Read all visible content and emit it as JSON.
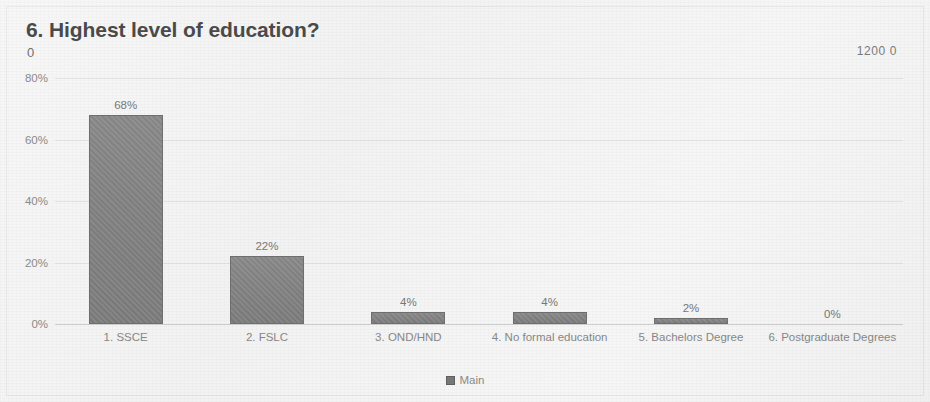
{
  "header": {
    "title": "6. Highest level of education?",
    "subtitle_zero": "0",
    "corner_value": "1200 0"
  },
  "legend": {
    "label": "Main",
    "swatch_icon": "legend-square-icon"
  },
  "colors": {
    "bar": "#848484",
    "bar_border": "#6e6e6e",
    "text": "#868686",
    "title": "#4a4a4a",
    "gridline": "#ededed",
    "background": "#f4f4f4"
  },
  "chart_data": {
    "type": "bar",
    "title": "6. Highest level of education?",
    "xlabel": "",
    "ylabel": "",
    "categories": [
      "1. SSCE",
      "2. FSLC",
      "3. OND/HND",
      "4. No formal education",
      "5. Bachelors Degree",
      "6. Postgraduate Degrees"
    ],
    "values": [
      68,
      22,
      4,
      4,
      2,
      0
    ],
    "data_labels": [
      "68%",
      "22%",
      "4%",
      "4%",
      "2%",
      "0%"
    ],
    "series": [
      {
        "name": "Main",
        "values": [
          68,
          22,
          4,
          4,
          2,
          0
        ]
      }
    ],
    "ylim": [
      0,
      80
    ],
    "ytick_values": [
      80,
      60,
      40,
      20,
      0
    ],
    "ytick_labels": [
      "80%",
      "60%",
      "40%",
      "20%",
      "0%"
    ],
    "grid": true,
    "legend_position": "bottom"
  }
}
